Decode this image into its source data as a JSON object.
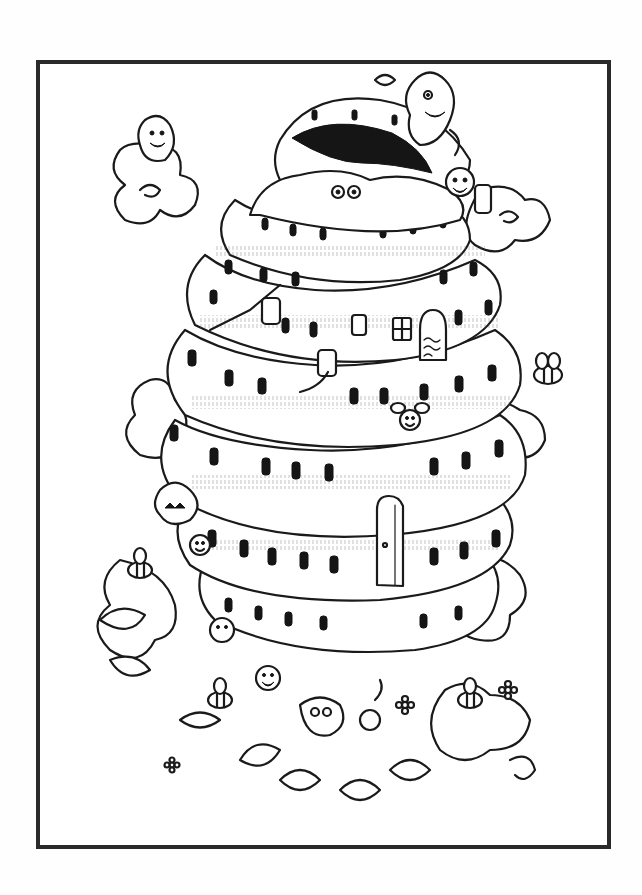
{
  "artwork": {
    "type": "coloring-page line art",
    "subject": "tiered beehive tower covered with doodle creatures, bees, clouds, swirls and leaves",
    "style": "black ink on white",
    "colors": {
      "background": "#ffffff",
      "ink": "#1a1a1a",
      "frame": "#2a2a2a"
    },
    "elements": [
      {
        "name": "frame-border"
      },
      {
        "name": "beehive-tower",
        "tiers": 6
      },
      {
        "name": "open-top-mouth"
      },
      {
        "name": "tower-door"
      },
      {
        "name": "cross-window"
      },
      {
        "name": "arched-doorway"
      },
      {
        "name": "bees"
      },
      {
        "name": "doodle-monsters"
      },
      {
        "name": "swirl-clouds"
      },
      {
        "name": "leaves-and-flowers"
      },
      {
        "name": "pipes"
      }
    ]
  }
}
